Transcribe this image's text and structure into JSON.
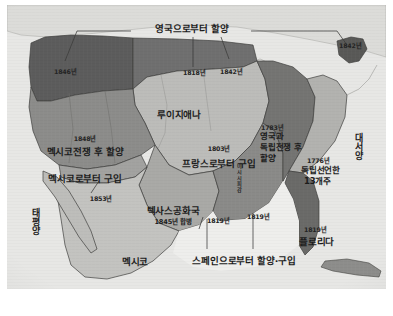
{
  "figure": {
    "kind": "historical-map",
    "region": "United States territorial expansion",
    "language": "Korean"
  },
  "colors": {
    "paper": "#d8d8d6",
    "ocean": "#e8e8e6",
    "britain_cession": "#6f6f6f",
    "oregon": "#5c5c5c",
    "louisiana": "#b9b9b6",
    "mexican_cession": "#8e8e8c",
    "gadsden": "#9a9a98",
    "texas": "#a8a8a5",
    "original_13": "#b2b2af",
    "britain_war": "#767674",
    "spain": "#8a8a88",
    "florida": "#6b6b69",
    "mexico": "#c2c2bf",
    "border": "#4a4a48",
    "text": "#1b1b1b",
    "leader_line": "#3a3a38"
  },
  "labels": {
    "ceded_from_britain": "영국으로부터 할양",
    "year_1846": "1846년",
    "year_1818": "1818년",
    "year_1842_mid": "1842년",
    "year_1842_top_right": "1842년",
    "louisiana": "루이지애나",
    "year_1848": "1848년",
    "mexican_war_cession": "멕시코전쟁 후 할양",
    "purchased_from_mexico": "멕시코로부터 구입",
    "year_1853": "1853년",
    "year_1803": "1803년",
    "purchased_from_france": "프랑스로부터 구입",
    "year_1783": "1783년",
    "britain_war_cession_line1": "영국과",
    "britain_war_cession_line2": "독립전쟁 후",
    "britain_war_cession_line3": "할양",
    "year_1776": "1776년",
    "declared_independence": "독립선언한",
    "thirteen_states": "13개주",
    "texas_republic": "텍사스공화국",
    "texas_annexed": "1845년 합병",
    "year_1819_west": "1819년",
    "year_1819_gulf": "1819년",
    "ceded_purchased_from_spain": "스페인으로부터 할양·구입",
    "year_1819_florida": "1819년",
    "florida": "플로리다",
    "mexico": "멕시코",
    "pacific_ocean": "태평양",
    "atlantic_ocean": "대서양",
    "mississippi_river": "미시시피강"
  }
}
